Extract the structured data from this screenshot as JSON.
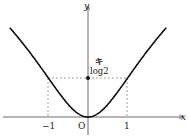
{
  "chart_data": {
    "type": "line",
    "title": "",
    "function": "y = log(1 + x^2)",
    "xlabel": "x",
    "ylabel": "y",
    "origin_label": "O",
    "x_ticks": [
      {
        "value": -1,
        "label": "−1"
      },
      {
        "value": 1,
        "label": "1"
      }
    ],
    "y_ticks": [
      {
        "value": 0.693,
        "label": "log2"
      }
    ],
    "annotation": "キ",
    "points": [
      {
        "x": -2.0,
        "y": 1.609
      },
      {
        "x": -1.5,
        "y": 1.179
      },
      {
        "x": -1.0,
        "y": 0.693
      },
      {
        "x": -0.5,
        "y": 0.223
      },
      {
        "x": 0.0,
        "y": 0.0
      },
      {
        "x": 0.5,
        "y": 0.223
      },
      {
        "x": 1.0,
        "y": 0.693
      },
      {
        "x": 1.5,
        "y": 1.179
      },
      {
        "x": 2.0,
        "y": 1.609
      }
    ],
    "guides": "dashed lines from (±1, log2) to axes",
    "grid": false,
    "legend": null
  },
  "labels": {
    "x_axis": "x",
    "y_axis": "y",
    "origin": "O",
    "tick_neg1": "−1",
    "tick_pos1": "1",
    "log2": "log2",
    "annotation": "キ"
  }
}
